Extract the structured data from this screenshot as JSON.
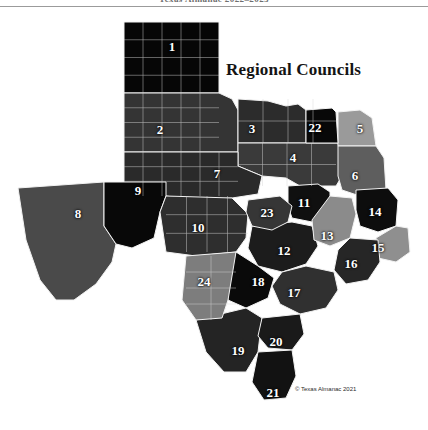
{
  "page": {
    "running_head": "Texas Almanac 2022–2023",
    "title": "Regional Councils",
    "credit": "© Texas Almanac 2021"
  },
  "palette": {
    "background": "#ffffff",
    "county_border": "#d9d9d9",
    "region_border": "#f2f2f2",
    "label_text": "#ffffff",
    "title_text": "#141414",
    "tone_black": "#060606",
    "tone_darkest": "#141414",
    "tone_dark": "#242424",
    "tone_mid_dark": "#343434",
    "tone_mid": "#4a4a4a",
    "tone_mid_light": "#5e5e5e",
    "tone_light": "#7d7d7d",
    "tone_lighter": "#9a9a9a"
  },
  "map": {
    "name": "Texas Regional Councils",
    "projection": "plain",
    "regions": [
      {
        "id": 1,
        "label": "1",
        "tone": "#060606",
        "lx": 172,
        "ly": 46,
        "name": "Panhandle"
      },
      {
        "id": 2,
        "label": "2",
        "tone": "#343434",
        "lx": 160,
        "ly": 129,
        "name": "South Plains"
      },
      {
        "id": 3,
        "label": "3",
        "tone": "#2c2c2c",
        "lx": 252,
        "ly": 128,
        "name": "North Texas"
      },
      {
        "id": 4,
        "label": "4",
        "tone": "#3a3a3a",
        "lx": 293,
        "ly": 157,
        "name": "North Central Texas"
      },
      {
        "id": 5,
        "label": "5",
        "tone": "#9a9a9a",
        "lx": 360,
        "ly": 128,
        "name": "Ark-Tex"
      },
      {
        "id": 6,
        "label": "6",
        "tone": "#5e5e5e",
        "lx": 355,
        "ly": 175,
        "name": "East Texas"
      },
      {
        "id": 7,
        "label": "7",
        "tone": "#2a2a2a",
        "lx": 217,
        "ly": 173,
        "name": "West Central Texas"
      },
      {
        "id": 8,
        "label": "8",
        "tone": "#4a4a4a",
        "lx": 78,
        "ly": 213,
        "name": "Rio Grande"
      },
      {
        "id": 9,
        "label": "9",
        "tone": "#080808",
        "lx": 138,
        "ly": 190,
        "name": "Permian Basin"
      },
      {
        "id": 10,
        "label": "10",
        "tone": "#2e2e2e",
        "lx": 198,
        "ly": 227,
        "name": "Concho Valley"
      },
      {
        "id": 11,
        "label": "11",
        "tone": "#101010",
        "lx": 304,
        "ly": 202,
        "name": "Heart of Texas"
      },
      {
        "id": 12,
        "label": "12",
        "tone": "#1c1c1c",
        "lx": 284,
        "ly": 250,
        "name": "Capital Area"
      },
      {
        "id": 13,
        "label": "13",
        "tone": "#8b8b8b",
        "lx": 327,
        "ly": 235,
        "name": "Brazos Valley"
      },
      {
        "id": 14,
        "label": "14",
        "tone": "#0d0d0d",
        "lx": 375,
        "ly": 211,
        "name": "Deep East Texas"
      },
      {
        "id": 15,
        "label": "15",
        "tone": "#8f8f8f",
        "lx": 378,
        "ly": 247,
        "name": "South East Texas"
      },
      {
        "id": 16,
        "label": "16",
        "tone": "#262626",
        "lx": 351,
        "ly": 263,
        "name": "Houston-Galveston"
      },
      {
        "id": 17,
        "label": "17",
        "tone": "#303030",
        "lx": 294,
        "ly": 292,
        "name": "Golden Crescent"
      },
      {
        "id": 18,
        "label": "18",
        "tone": "#0a0a0a",
        "lx": 258,
        "ly": 281,
        "name": "Alamo Area"
      },
      {
        "id": 19,
        "label": "19",
        "tone": "#242424",
        "lx": 238,
        "ly": 350,
        "name": "South Texas"
      },
      {
        "id": 20,
        "label": "20",
        "tone": "#1a1a1a",
        "lx": 276,
        "ly": 341,
        "name": "Coastal Bend"
      },
      {
        "id": 21,
        "label": "21",
        "tone": "#121212",
        "lx": 273,
        "ly": 392,
        "name": "Lower Rio Grande Valley"
      },
      {
        "id": 22,
        "label": "22",
        "tone": "#080808",
        "lx": 315,
        "ly": 127,
        "name": "Texoma"
      },
      {
        "id": 23,
        "label": "23",
        "tone": "#363636",
        "lx": 267,
        "ly": 212,
        "name": "Central Texas"
      },
      {
        "id": 24,
        "label": "24",
        "tone": "#7d7d7d",
        "lx": 204,
        "ly": 281,
        "name": "Middle Rio Grande"
      }
    ]
  }
}
